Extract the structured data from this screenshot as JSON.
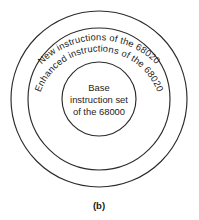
{
  "figure": {
    "caption": "(b)",
    "background_color": "#ffffff",
    "stroke_color": "#2b2b2b",
    "text_color": "#1c1c1c"
  },
  "diagram": {
    "type": "concentric-circles",
    "rings": [
      {
        "id": "outer",
        "label": "New instructions of the 68020",
        "layout": "curved-arc",
        "radius": 88
      },
      {
        "id": "middle",
        "label": "Enhanced instructions of the 68020",
        "layout": "curved-arc",
        "radius": 71
      },
      {
        "id": "inner",
        "label": "Base instruction set of the 68000",
        "layout": "horizontal-lines",
        "radius": 37,
        "lines": [
          "Base",
          "instruction set",
          "of the 68000"
        ]
      }
    ]
  }
}
